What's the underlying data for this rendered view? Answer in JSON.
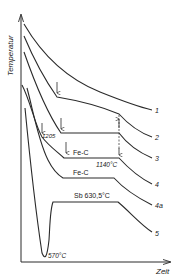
{
  "figure": {
    "type": "cooling-curves",
    "axes": {
      "y_label": "Temperatur",
      "x_label": "Zeit"
    },
    "curves": [
      {
        "id": "1",
        "label": "1"
      },
      {
        "id": "2",
        "label": "2"
      },
      {
        "id": "3",
        "label": "3"
      },
      {
        "id": "4",
        "label": "4"
      },
      {
        "id": "4a",
        "label": "4a"
      },
      {
        "id": "5",
        "label": "5"
      }
    ],
    "annotations": {
      "t_1205": "1205",
      "fe_c_1": "Fe-C",
      "t_1140": "1140°C",
      "fe_c_2": "Fe-C",
      "sb": "Sb 630,5°C",
      "t_570": "570°C"
    },
    "line_color": "#2a2a2a"
  }
}
